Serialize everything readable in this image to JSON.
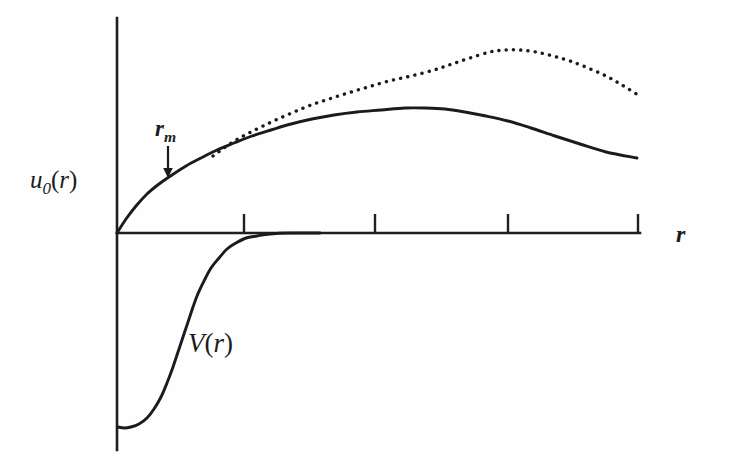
{
  "figure": {
    "background_color": "#fefefe",
    "line_color": "#1b1b1b",
    "axis_color": "#1f1f1f"
  },
  "labels": {
    "y_axis": {
      "base": "u",
      "subscript": "0",
      "arg": "(r)",
      "full": "u0(r)"
    },
    "x_axis": {
      "full": "r"
    },
    "marker": {
      "base": "r",
      "subscript": "m",
      "full": "rm"
    },
    "potential": {
      "full": "V(r)"
    }
  },
  "chart_data": {
    "type": "line",
    "title": "",
    "xlabel": "r",
    "ylabel": "u_0(r)",
    "grid": false,
    "legend": null,
    "annotations": [
      {
        "text": "r_m",
        "kind": "arrow-label",
        "description": "downward arrow marking the matching radius r_m on the u_0(r) curve",
        "x_px": 168,
        "arrow_from_y_px": 147,
        "arrow_to_y_px": 177
      },
      {
        "text": "V(r)",
        "kind": "curve-label",
        "description": "label for the attractive potential well curve below the axis",
        "x_px": 195,
        "y_px": 345
      }
    ],
    "axes": {
      "origin_px": {
        "x": 117,
        "y": 233
      },
      "x_axis_px": {
        "from_x": 117,
        "to_x": 640,
        "y": 233
      },
      "y_axis_px": {
        "x": 117,
        "from_y": 18,
        "to_y": 450
      },
      "x_ticks_px": [
        244,
        375,
        508,
        638
      ],
      "x_tick_length_px": 19,
      "x_tick_direction": "up",
      "y_ticks_px": [],
      "tick_labels": []
    },
    "series": [
      {
        "name": "u_0(r) numerical solution",
        "style": "solid",
        "points_px": [
          [
            117,
            233
          ],
          [
            126,
            219
          ],
          [
            136,
            206
          ],
          [
            147,
            194
          ],
          [
            159,
            184
          ],
          [
            172,
            175
          ],
          [
            186,
            166
          ],
          [
            201,
            158
          ],
          [
            217,
            150
          ],
          [
            234,
            143
          ],
          [
            252,
            136
          ],
          [
            271,
            130
          ],
          [
            291,
            124
          ],
          [
            312,
            119
          ],
          [
            334,
            115
          ],
          [
            357,
            112
          ],
          [
            381,
            110
          ],
          [
            405,
            108
          ],
          [
            425,
            108
          ],
          [
            445,
            109
          ],
          [
            465,
            112
          ],
          [
            486,
            116
          ],
          [
            508,
            121
          ],
          [
            531,
            128
          ],
          [
            555,
            136
          ],
          [
            580,
            144
          ],
          [
            606,
            152
          ],
          [
            637,
            158
          ]
        ]
      },
      {
        "name": "asymptotic / free-particle extrapolation",
        "style": "dotted",
        "points_px": [
          [
            213,
            156
          ],
          [
            224,
            148
          ],
          [
            236,
            140
          ],
          [
            249,
            133
          ],
          [
            263,
            126
          ],
          [
            278,
            119
          ],
          [
            294,
            112
          ],
          [
            311,
            105
          ],
          [
            329,
            99
          ],
          [
            348,
            93
          ],
          [
            368,
            87
          ],
          [
            389,
            81
          ],
          [
            411,
            76
          ],
          [
            434,
            70
          ],
          [
            452,
            64
          ],
          [
            470,
            58
          ],
          [
            490,
            52
          ],
          [
            505,
            50
          ],
          [
            520,
            50
          ],
          [
            536,
            52
          ],
          [
            553,
            56
          ],
          [
            570,
            61
          ],
          [
            588,
            68
          ],
          [
            606,
            76
          ],
          [
            622,
            85
          ],
          [
            638,
            95
          ]
        ]
      },
      {
        "name": "V(r) interaction potential",
        "style": "solid",
        "points_px": [
          [
            118,
            427
          ],
          [
            124,
            428
          ],
          [
            131,
            427
          ],
          [
            139,
            424
          ],
          [
            147,
            418
          ],
          [
            154,
            409
          ],
          [
            161,
            397
          ],
          [
            167,
            383
          ],
          [
            173,
            367
          ],
          [
            179,
            349
          ],
          [
            185,
            331
          ],
          [
            191,
            313
          ],
          [
            197,
            296
          ],
          [
            204,
            281
          ],
          [
            211,
            268
          ],
          [
            219,
            258
          ],
          [
            227,
            249
          ],
          [
            236,
            243
          ],
          [
            246,
            238
          ],
          [
            257,
            236
          ],
          [
            270,
            234
          ],
          [
            290,
            233
          ],
          [
            320,
            233
          ]
        ]
      }
    ]
  }
}
